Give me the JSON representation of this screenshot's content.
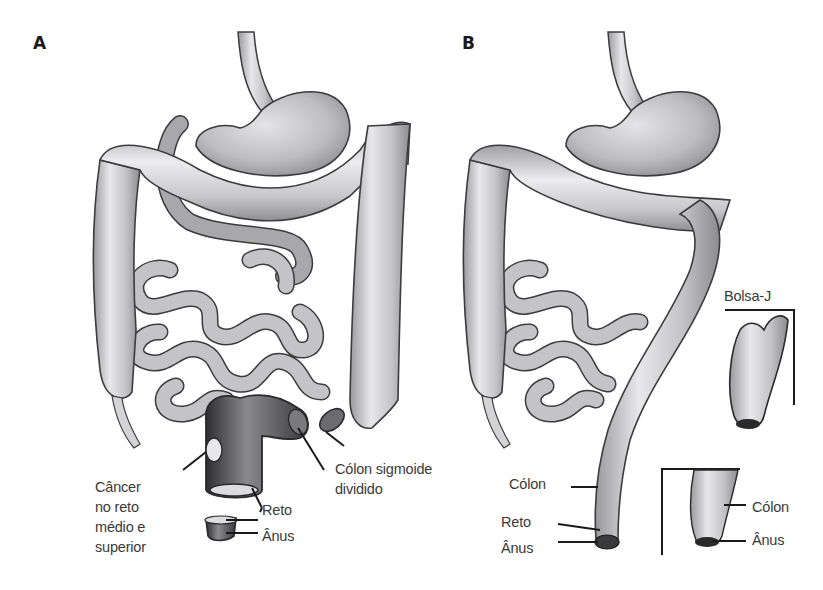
{
  "figure": {
    "panels": [
      {
        "id": "A",
        "letter": "A",
        "labels": {
          "cancer": "Câncer\nno reto\nmédio e\nsuperior",
          "reto": "Reto",
          "anus": "Ânus",
          "sigmoid": "Cólon sigmoide\ndividido"
        }
      },
      {
        "id": "B",
        "letter": "B",
        "labels": {
          "colon": "Cólon",
          "reto": "Reto",
          "anus": "Ânus",
          "jpouch": "Bolsa-J",
          "inset_colon": "Cólon",
          "inset_anus": "Ânus"
        }
      }
    ],
    "colors": {
      "organ_fill": "#c9c9cc",
      "organ_light": "#e6e6e8",
      "organ_outline": "#3c3c3c",
      "dark_tissue": "#2a2a2a",
      "text": "#3a3a3a",
      "leader_line": "#1a1a1a"
    }
  }
}
